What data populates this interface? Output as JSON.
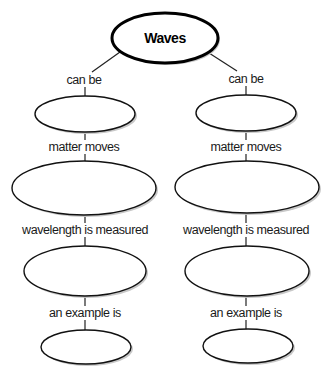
{
  "diagram": {
    "type": "concept-map",
    "root": {
      "label": "Waves"
    },
    "branches": [
      {
        "side": "left",
        "links": [
          "can be",
          "matter moves",
          "wavelength is measured",
          "an example is"
        ],
        "nodes": [
          "",
          "",
          "",
          ""
        ]
      },
      {
        "side": "right",
        "links": [
          "can be",
          "matter moves",
          "wavelength is measured",
          "an example is"
        ],
        "nodes": [
          "",
          "",
          "",
          ""
        ]
      }
    ]
  }
}
